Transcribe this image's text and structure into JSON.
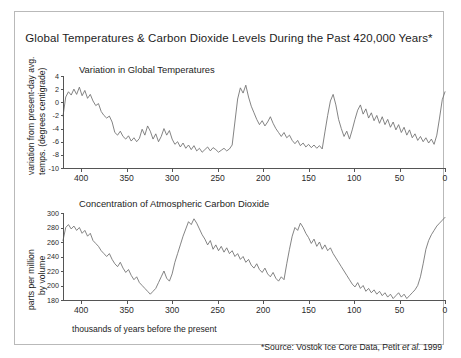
{
  "figure": {
    "title": "Global Temperatures & Carbon Dioxide Levels During the Past 420,000 Years*",
    "x_caption": "thousands of years before the present",
    "source_prefix": "*Source: Vostok Ice Core Data, Petit ",
    "source_italic": "et al.",
    "source_suffix": " 1999",
    "border_color": "#b9b9b9",
    "series_color": "#6e6e6e",
    "axis_color": "#555555"
  },
  "temperature_panel": {
    "subtitle": "Variation in Global Temperatures",
    "ylabel_line1": "variation from present-day avg.",
    "ylabel_line2": "temps. (degrees centigrade)",
    "ytick_labels": [
      "4",
      "2",
      "0",
      "-2",
      "-4",
      "-6",
      "-8",
      "-10"
    ],
    "xtick_labels": [
      "400",
      "350",
      "300",
      "250",
      "200",
      "150",
      "100",
      "50",
      "0"
    ]
  },
  "co2_panel": {
    "subtitle": "Concentration of Atmosphpheric Carbon Dioxide",
    "subtitle_display": "Concentration of Atmospheric Carbon Dioxide",
    "ylabel_line1": "parts per million",
    "ylabel_line2": "by volume",
    "ytick_labels": [
      "300",
      "280",
      "260",
      "240",
      "220",
      "200",
      "180"
    ],
    "xtick_labels": [
      "400",
      "350",
      "300",
      "250",
      "200",
      "150",
      "100",
      "50",
      "0"
    ]
  },
  "chart_data": [
    {
      "type": "line",
      "title": "Variation in Global Temperatures",
      "xlabel": "thousands of years before the present",
      "ylabel": "variation from present-day avg. temps. (degrees centigrade)",
      "xlim": [
        420,
        0
      ],
      "ylim": [
        -10,
        4
      ],
      "x_ticks": [
        400,
        350,
        300,
        250,
        200,
        150,
        100,
        50,
        0
      ],
      "y_ticks": [
        4,
        2,
        0,
        -2,
        -4,
        -6,
        -8,
        -10
      ],
      "x_reversed": true,
      "grid": false,
      "legend": "none",
      "x": [
        420,
        417,
        414,
        411,
        408,
        405,
        402,
        399,
        396,
        393,
        390,
        387,
        384,
        381,
        378,
        375,
        372,
        369,
        366,
        363,
        360,
        357,
        354,
        351,
        348,
        345,
        342,
        339,
        336,
        333,
        330,
        327,
        324,
        321,
        318,
        315,
        312,
        309,
        306,
        303,
        300,
        297,
        294,
        291,
        288,
        285,
        282,
        279,
        276,
        273,
        270,
        267,
        264,
        261,
        258,
        255,
        252,
        249,
        246,
        243,
        240,
        237,
        234,
        231,
        228,
        225,
        222,
        219,
        216,
        213,
        210,
        207,
        204,
        201,
        198,
        195,
        192,
        189,
        186,
        183,
        180,
        177,
        174,
        171,
        168,
        165,
        162,
        159,
        156,
        153,
        150,
        147,
        144,
        141,
        138,
        135,
        132,
        129,
        126,
        123,
        120,
        117,
        114,
        111,
        108,
        105,
        102,
        99,
        96,
        93,
        90,
        87,
        84,
        81,
        78,
        75,
        72,
        69,
        66,
        63,
        60,
        57,
        54,
        51,
        48,
        45,
        42,
        39,
        36,
        33,
        30,
        27,
        24,
        21,
        18,
        15,
        12,
        9,
        6,
        3,
        0
      ],
      "y": [
        -2.1,
        0.8,
        1.6,
        1.1,
        2.0,
        1.2,
        2.3,
        1.0,
        1.8,
        0.6,
        1.2,
        0.2,
        -0.5,
        -0.2,
        -1.4,
        -2.0,
        -2.4,
        -2.1,
        -3.0,
        -4.6,
        -5.0,
        -4.4,
        -5.2,
        -5.6,
        -5.1,
        -5.9,
        -5.4,
        -6.0,
        -5.5,
        -4.1,
        -5.0,
        -3.6,
        -4.4,
        -5.6,
        -4.8,
        -6.0,
        -5.2,
        -4.0,
        -5.0,
        -4.3,
        -5.6,
        -6.4,
        -6.0,
        -6.8,
        -6.2,
        -7.0,
        -6.5,
        -7.2,
        -6.6,
        -7.4,
        -7.0,
        -7.6,
        -7.2,
        -6.8,
        -7.4,
        -6.9,
        -7.2,
        -7.6,
        -7.3,
        -7.0,
        -7.4,
        -7.1,
        -6.5,
        -3.0,
        0.5,
        2.2,
        1.4,
        2.6,
        0.8,
        -0.6,
        -1.6,
        -2.6,
        -3.4,
        -2.8,
        -3.6,
        -3.0,
        -2.2,
        -3.2,
        -4.0,
        -4.6,
        -5.2,
        -4.6,
        -5.4,
        -5.0,
        -5.8,
        -6.3,
        -5.8,
        -6.6,
        -6.2,
        -6.8,
        -6.4,
        -6.9,
        -6.5,
        -7.0,
        -6.6,
        -7.1,
        -4.5,
        -2.0,
        0.2,
        1.2,
        -0.4,
        -2.6,
        -4.0,
        -5.2,
        -4.4,
        -5.6,
        -4.2,
        -2.6,
        -1.2,
        -0.4,
        -1.8,
        -1.0,
        -2.4,
        -1.6,
        -2.8,
        -2.0,
        -3.2,
        -2.2,
        -3.4,
        -2.6,
        -3.8,
        -3.0,
        -4.2,
        -3.4,
        -4.6,
        -3.8,
        -5.0,
        -4.2,
        -5.4,
        -4.8,
        -5.8,
        -5.2,
        -6.0,
        -5.4,
        -6.2,
        -5.6,
        -6.4,
        -5.0,
        -2.4,
        0.4,
        1.6,
        0.9,
        2.0,
        1.3,
        1.9
      ]
    },
    {
      "type": "line",
      "title": "Concentration of Atmospheric Carbon Dioxide",
      "xlabel": "thousands of years before the present",
      "ylabel": "parts per million by volume",
      "unit": "ppmv",
      "xlim": [
        420,
        0
      ],
      "ylim": [
        180,
        300
      ],
      "x_ticks": [
        400,
        350,
        300,
        250,
        200,
        150,
        100,
        50,
        0
      ],
      "y_ticks": [
        300,
        280,
        260,
        240,
        220,
        200,
        180
      ],
      "x_reversed": true,
      "grid": false,
      "legend": "none",
      "x": [
        420,
        417,
        414,
        411,
        408,
        405,
        402,
        399,
        396,
        393,
        390,
        387,
        384,
        381,
        378,
        375,
        372,
        369,
        366,
        363,
        360,
        357,
        354,
        351,
        348,
        345,
        342,
        339,
        336,
        333,
        330,
        327,
        324,
        321,
        318,
        315,
        312,
        309,
        306,
        303,
        300,
        297,
        294,
        291,
        288,
        285,
        282,
        279,
        276,
        273,
        270,
        267,
        264,
        261,
        258,
        255,
        252,
        249,
        246,
        243,
        240,
        237,
        234,
        231,
        228,
        225,
        222,
        219,
        216,
        213,
        210,
        207,
        204,
        201,
        198,
        195,
        192,
        189,
        186,
        183,
        180,
        177,
        174,
        171,
        168,
        165,
        162,
        159,
        156,
        153,
        150,
        147,
        144,
        141,
        138,
        135,
        132,
        129,
        126,
        123,
        120,
        117,
        114,
        111,
        108,
        105,
        102,
        99,
        96,
        93,
        90,
        87,
        84,
        81,
        78,
        75,
        72,
        69,
        66,
        63,
        60,
        57,
        54,
        51,
        48,
        45,
        42,
        39,
        36,
        33,
        30,
        27,
        24,
        21,
        18,
        15,
        12,
        9,
        6,
        3,
        0
      ],
      "y": [
        262,
        280,
        284,
        278,
        282,
        276,
        280,
        272,
        276,
        268,
        272,
        262,
        258,
        254,
        248,
        244,
        240,
        244,
        236,
        230,
        226,
        232,
        224,
        218,
        222,
        214,
        208,
        212,
        204,
        200,
        196,
        192,
        188,
        192,
        196,
        204,
        212,
        220,
        210,
        206,
        216,
        232,
        244,
        256,
        268,
        278,
        288,
        284,
        292,
        286,
        278,
        270,
        264,
        256,
        262,
        250,
        256,
        248,
        254,
        246,
        252,
        244,
        248,
        240,
        244,
        236,
        240,
        232,
        236,
        228,
        224,
        230,
        222,
        218,
        224,
        216,
        212,
        218,
        210,
        206,
        212,
        208,
        230,
        250,
        268,
        280,
        276,
        286,
        280,
        272,
        266,
        258,
        264,
        254,
        260,
        250,
        256,
        248,
        252,
        244,
        238,
        232,
        226,
        220,
        214,
        208,
        202,
        198,
        204,
        196,
        200,
        192,
        196,
        190,
        194,
        188,
        192,
        186,
        190,
        184,
        188,
        182,
        186,
        190,
        184,
        188,
        182,
        186,
        190,
        194,
        200,
        212,
        230,
        250,
        262,
        270,
        276,
        282,
        286,
        290,
        294
      ]
    }
  ]
}
